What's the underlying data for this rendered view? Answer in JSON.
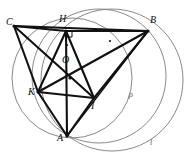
{
  "figure": {
    "width": 184,
    "height": 156,
    "background_color": "#ffffff",
    "stroke_color_segments": "#111111",
    "stroke_color_circles": "#7a7a7a"
  },
  "points": {
    "C": {
      "label": "C",
      "x": 14,
      "y": 26,
      "label_x": 6,
      "label_y": 17
    },
    "H": {
      "label": "H",
      "x": 66,
      "y": 31,
      "label_x": 59,
      "label_y": 14
    },
    "B": {
      "label": "B",
      "x": 148,
      "y": 31,
      "label_x": 150,
      "label_y": 15
    },
    "O": {
      "label": "O",
      "x": 70,
      "y": 78,
      "label_x": 62,
      "label_y": 55
    },
    "K": {
      "label": "K",
      "x": 38,
      "y": 92,
      "label_x": 28,
      "label_y": 87
    },
    "I": {
      "label": "I",
      "x": 94,
      "y": 98,
      "label_x": 91,
      "label_y": 101
    },
    "A": {
      "label": "A",
      "x": 67,
      "y": 136,
      "label_x": 57,
      "label_y": 133
    }
  },
  "segments": [
    {
      "name": "segment-C-H",
      "from": "C",
      "to": "H",
      "width": 2.1
    },
    {
      "name": "segment-H-B",
      "from": "H",
      "to": "B",
      "width": 2.1
    },
    {
      "name": "segment-C-B",
      "from": "C",
      "to": "B",
      "width": 2.1
    },
    {
      "name": "segment-C-K",
      "from": "C",
      "to": "K",
      "width": 2.1
    },
    {
      "name": "segment-C-I",
      "from": "C",
      "to": "I",
      "width": 2.1
    },
    {
      "name": "segment-H-K",
      "from": "H",
      "to": "K",
      "width": 2.1
    },
    {
      "name": "segment-H-I",
      "from": "H",
      "to": "I",
      "width": 2.1
    },
    {
      "name": "segment-H-A",
      "from": "H",
      "to": "A",
      "width": 2.1
    },
    {
      "name": "segment-B-K",
      "from": "B",
      "to": "K",
      "width": 2.1
    },
    {
      "name": "segment-B-I",
      "from": "B",
      "to": "I",
      "width": 2.1
    },
    {
      "name": "segment-K-I",
      "from": "K",
      "to": "I",
      "width": 2.1
    },
    {
      "name": "segment-K-A",
      "from": "K",
      "to": "A",
      "width": 2.1
    },
    {
      "name": "segment-I-A",
      "from": "I",
      "to": "A",
      "width": 2.1
    },
    {
      "name": "segment-B-A",
      "from": "B",
      "to": "A",
      "width": 1.4
    }
  ],
  "circles": [
    {
      "name": "circumcircle-rho",
      "cx": 99,
      "cy": 76,
      "r": 67,
      "width": 0.9
    },
    {
      "name": "circle-through-H-K-A",
      "cx": 72,
      "cy": 78,
      "r": 60,
      "width": 0.9
    },
    {
      "name": "circle-l-large",
      "cx": 112,
      "cy": 80,
      "r": 71,
      "width": 0.9
    }
  ],
  "right_angle_marks": [
    {
      "name": "right-angle-at-H",
      "x": 66,
      "y": 31,
      "size": 6
    }
  ],
  "tick_marks": [
    {
      "name": "tick-on-HB",
      "x": 110,
      "y": 41
    },
    {
      "name": "tick-on-HA",
      "x": 67,
      "y": 45
    }
  ],
  "curve_labels": {
    "rho": {
      "label": "ρ",
      "x": 129,
      "y": 91
    },
    "l": {
      "label": "l",
      "x": 150,
      "y": 139
    }
  }
}
